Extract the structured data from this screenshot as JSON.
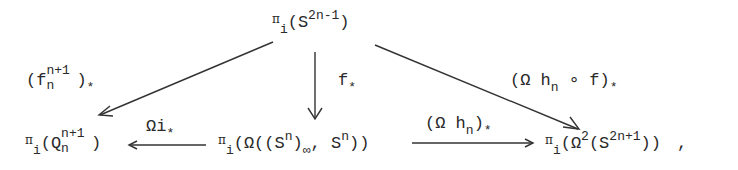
{
  "diagram": {
    "type": "commutative-diagram",
    "nodes": {
      "top": {
        "pi": "π",
        "i": "i",
        "open": "(S",
        "sup": "2n-1",
        "close": ")"
      },
      "bottom_left": {
        "pi": "π",
        "i": "i",
        "open": "(Q",
        "sup": "n+1",
        "sub": "n",
        "close": ")"
      },
      "bottom_middle": {
        "pi": "π",
        "i": "i",
        "part1": "(Ω((S",
        "sup1": "n",
        "part2": ")",
        "sub": "∞",
        "part3": ", S",
        "sup2": "n",
        "part4": "))"
      },
      "bottom_right": {
        "pi": "π",
        "i": "i",
        "part1": "(Ω",
        "sup1": "2",
        "part2": "(S",
        "sup2": "2n+1",
        "part3": "))",
        "trail": ","
      }
    },
    "arrows": {
      "top_to_left": {
        "pre": "(f",
        "sup": "n+1",
        "sub": "n",
        "post": ")",
        "star": "*"
      },
      "top_to_middle": {
        "main": "f",
        "star": "*"
      },
      "top_to_right": {
        "pre": "(Ω h",
        "sub": "n",
        "post": " ∘ f)",
        "star": "*"
      },
      "middle_to_left": {
        "main": "Ωi",
        "star": "*"
      },
      "middle_to_right": {
        "pre": "(Ω h",
        "sub": "n",
        "post": ")",
        "star": "*"
      }
    }
  }
}
